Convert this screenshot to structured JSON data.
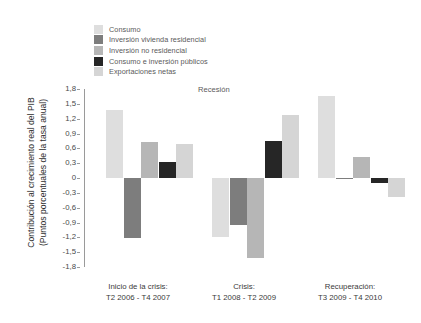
{
  "chart_data": {
    "type": "bar",
    "title": "",
    "subtitle": "",
    "xlabel": "",
    "ylabel": "Contribución al crecimiento real del PIB (Puntos porcentuales de la tasa anual)",
    "ylabel_line1": "Contribución al crecimiento real del PIB",
    "ylabel_line2": "(Puntos porcentuales de la tasa anual)",
    "ylim": [
      -1.8,
      1.8
    ],
    "ytick_labels": [
      "1,8",
      "1,5",
      "1,2",
      "0,9",
      "0,6",
      "0,3",
      "0",
      "-0,3",
      "-0,6",
      "-0,9",
      "-1,2",
      "-1,5",
      "-1,8"
    ],
    "ytick_values": [
      1.8,
      1.5,
      1.2,
      0.9,
      0.6,
      0.3,
      0,
      -0.3,
      -0.6,
      -0.9,
      -1.2,
      -1.5,
      -1.8
    ],
    "grid": false,
    "legend_position": "top-left",
    "categories": [
      "Inicio de la crisis:\nT2 2006 - T4 2007",
      "Crisis:\nT1 2008 - T2 2009",
      "Recuperación:\nT3 2009 - T4 2010"
    ],
    "category_labels": [
      {
        "line1": "Inicio de la crisis:",
        "line2": "T2 2006 - T4 2007"
      },
      {
        "line1": "Crisis:",
        "line2": "T1 2008 - T2 2009"
      },
      {
        "line1": "Recuperación:",
        "line2": "T3 2009 - T4 2010"
      }
    ],
    "series": [
      {
        "name": "Consumo",
        "color": "#dedede",
        "values": [
          1.38,
          -1.2,
          1.65
        ]
      },
      {
        "name": "Inversión vivienda residencial",
        "color": "#7d7d7d",
        "values": [
          -1.22,
          -0.95,
          -0.02
        ]
      },
      {
        "name": "Inversión no residencial",
        "color": "#b6b6b6",
        "values": [
          0.73,
          -1.62,
          0.42
        ]
      },
      {
        "name": "Consumo e inversión públicos",
        "color": "#262626",
        "values": [
          0.32,
          0.74,
          -0.1
        ]
      },
      {
        "name": "Exportaciones netas",
        "color": "#d5d5d5",
        "values": [
          0.69,
          1.27,
          -0.38
        ]
      }
    ],
    "annotations": [
      {
        "text": "Recesión",
        "x_category": "Crisis:\nT1 2008 - T2 2009",
        "y": 1.9
      }
    ]
  },
  "legend": {
    "items": [
      {
        "label": "Consumo",
        "color": "#dedede"
      },
      {
        "label": "Inversión vivienda residencial",
        "color": "#7d7d7d"
      },
      {
        "label": "Inversión no residencial",
        "color": "#b6b6b6"
      },
      {
        "label": "Consumo e inversión públicos",
        "color": "#262626"
      },
      {
        "label": "Exportaciones netas",
        "color": "#d5d5d5"
      }
    ]
  }
}
